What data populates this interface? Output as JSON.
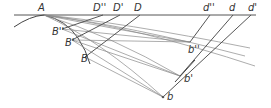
{
  "diagram": {
    "labels": {
      "A": "A",
      "D2": "D''",
      "D1": "D'",
      "D": "D",
      "d2": "d''",
      "d": "d",
      "d1": "d'",
      "B2": "B''",
      "B1": "B'",
      "B": "B",
      "b2": "b''",
      "b1": "b'",
      "b": "b"
    },
    "colors": {
      "line": "#555555",
      "ray": "#8a8a8a",
      "text": "#333333"
    }
  }
}
